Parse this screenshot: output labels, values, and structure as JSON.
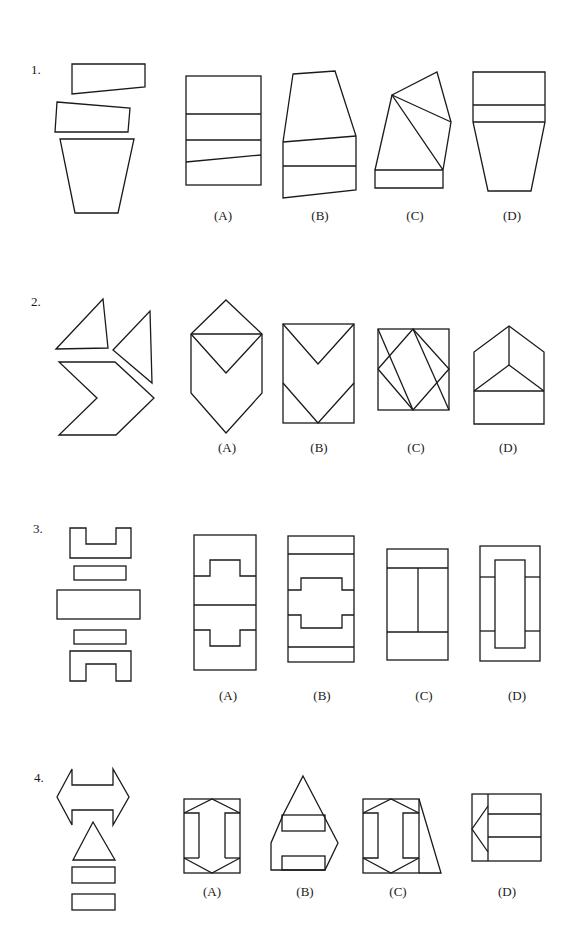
{
  "questions": [
    {
      "number": "1.",
      "options": [
        "(A)",
        "(B)",
        "(C)",
        "(D)"
      ]
    },
    {
      "number": "2.",
      "options": [
        "(A)",
        "(B)",
        "(C)",
        "(D)"
      ]
    },
    {
      "number": "3.",
      "options": [
        "(A)",
        "(B)",
        "(C)",
        "(D)"
      ]
    },
    {
      "number": "4.",
      "options": [
        "(A)",
        "(B)",
        "(C)",
        "(D)"
      ]
    }
  ]
}
